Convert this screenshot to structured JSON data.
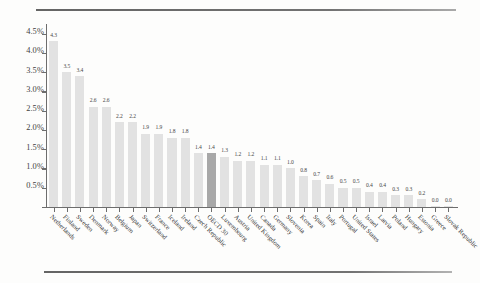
{
  "chart_data": {
    "type": "bar",
    "title": "",
    "xlabel": "",
    "ylabel": "",
    "ylim": [
      0,
      4.75
    ],
    "grid": false,
    "legend": "none",
    "yticks": [
      "0.5%",
      "1.0%",
      "1.5%",
      "2.0%",
      "2.5%",
      "3.0%",
      "3.5%",
      "4.0%",
      "4.5%"
    ],
    "ytick_values": [
      0.5,
      1.0,
      1.5,
      2.0,
      2.5,
      3.0,
      3.5,
      4.0,
      4.5
    ],
    "value_suffix": "",
    "highlight_category": "OECD 30",
    "highlight_color": "#a8a8a8",
    "bar_color": "#e2e2e2",
    "categories": [
      "Netherlands",
      "Finland",
      "Sweden",
      "Denmark",
      "Norway",
      "Belgium",
      "Japan",
      "Switzerland",
      "France",
      "Iceland",
      "Ireland",
      "Czech Republic",
      "OECD 30",
      "Luxembourg",
      "Austria",
      "United Kingdom",
      "Canada",
      "Germany",
      "Slovenia",
      "Korea",
      "Spain",
      "Italy",
      "Portugal",
      "United States",
      "Israel",
      "Latvia",
      "Poland",
      "Hungary",
      "Estonia",
      "Greece",
      "Slovak Republic"
    ],
    "values": [
      4.3,
      3.5,
      3.4,
      2.6,
      2.6,
      2.2,
      2.2,
      1.9,
      1.9,
      1.8,
      1.8,
      1.4,
      1.4,
      1.3,
      1.2,
      1.2,
      1.1,
      1.1,
      1.0,
      0.8,
      0.7,
      0.6,
      0.5,
      0.5,
      0.4,
      0.4,
      0.3,
      0.3,
      0.2,
      0.0,
      0.0
    ],
    "value_labels": [
      "4.3",
      "3.5",
      "3.4",
      "2.6",
      "2.6",
      "2.2",
      "2.2",
      "1.9",
      "1.9",
      "1.8",
      "1.8",
      "1.4",
      "1.4",
      "1.3",
      "1.2",
      "1.2",
      "1.1",
      "1.1",
      "1.0",
      "0.8",
      "0.7",
      "0.6",
      "0.5",
      "0.5",
      "0.4",
      "0.4",
      "0.3",
      "0.3",
      "0.2",
      "0.0",
      "0.0"
    ]
  }
}
